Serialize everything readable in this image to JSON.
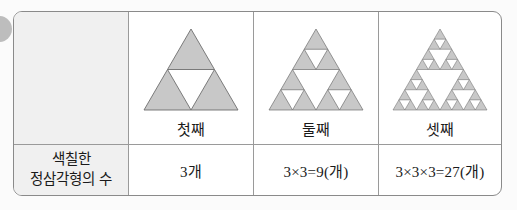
{
  "decoration": {
    "bullet_color": "#bdbdbd"
  },
  "table": {
    "border_color": "#8a8a8a",
    "header_cell_bg": "#f0f0f0",
    "shaded_triangle_fill": "#c8c8c8",
    "triangle_stroke": "#6e6e6e",
    "empty_header_cell_label": "",
    "row_header": {
      "line1": "색칠한",
      "line2": "정삼각형의 수"
    },
    "columns": [
      {
        "ordinal_label": "첫째",
        "count_text": "3개",
        "sierpinski_depth": 1,
        "shaded_count": 3
      },
      {
        "ordinal_label": "둘째",
        "count_text": "3×3=9(개)",
        "sierpinski_depth": 2,
        "shaded_count": 9
      },
      {
        "ordinal_label": "셋째",
        "count_text": "3×3×3=27(개)",
        "sierpinski_depth": 3,
        "shaded_count": 27
      }
    ]
  }
}
